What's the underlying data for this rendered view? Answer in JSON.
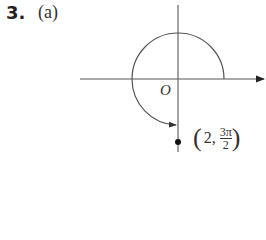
{
  "problem": {
    "number": "3.",
    "part": "(a)"
  },
  "diagram": {
    "origin_label": "O",
    "point": {
      "r": "2,",
      "theta_numerator": "3π",
      "theta_denominator": "2",
      "open_paren": "(",
      "close_paren": ")"
    },
    "colors": {
      "stroke": "#555555",
      "point": "#111111"
    }
  }
}
